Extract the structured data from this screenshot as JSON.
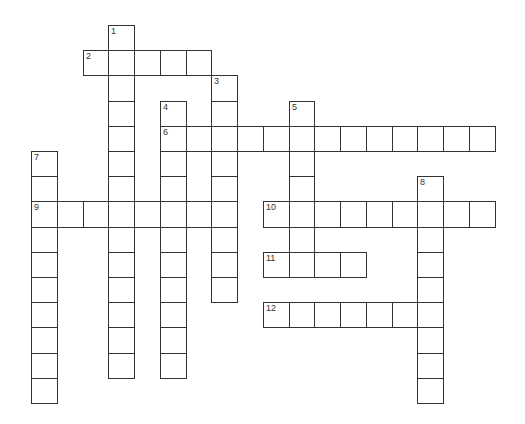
{
  "puzzle": {
    "type": "crossword",
    "grid": {
      "origin_x": 31,
      "origin_y": 25,
      "cell_w": 25.75,
      "cell_h": 25.2,
      "border_color": "#333333"
    },
    "words": [
      {
        "number": "1",
        "direction": "down",
        "row": 0,
        "col": 3,
        "length": 14
      },
      {
        "number": "2",
        "direction": "across",
        "row": 1,
        "col": 2,
        "length": 5
      },
      {
        "number": "3",
        "direction": "down",
        "row": 2,
        "col": 7,
        "length": 9
      },
      {
        "number": "4",
        "direction": "down",
        "row": 3,
        "col": 5,
        "length": 11
      },
      {
        "number": "5",
        "direction": "down",
        "row": 3,
        "col": 10,
        "length": 7
      },
      {
        "number": "6",
        "direction": "across",
        "row": 4,
        "col": 5,
        "length": 13
      },
      {
        "number": "7",
        "direction": "down",
        "row": 5,
        "col": 0,
        "length": 10
      },
      {
        "number": "8",
        "direction": "down",
        "row": 6,
        "col": 15,
        "length": 9
      },
      {
        "number": "9",
        "direction": "across",
        "row": 7,
        "col": 0,
        "length": 8
      },
      {
        "number": "10",
        "direction": "across",
        "row": 7,
        "col": 9,
        "length": 9
      },
      {
        "number": "11",
        "direction": "across",
        "row": 9,
        "col": 9,
        "length": 4
      },
      {
        "number": "12",
        "direction": "across",
        "row": 11,
        "col": 9,
        "length": 7
      }
    ]
  }
}
